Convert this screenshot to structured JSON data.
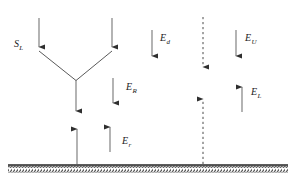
{
  "figure": {
    "type": "energy-flux-diagram",
    "width": 294,
    "height": 186,
    "background_color": "#ffffff",
    "stroke_color": "#3a3a3a",
    "ground_color": "#2b2b2b",
    "label_color": "#1a1a1a"
  },
  "labels": {
    "solar_incoming": {
      "symbol": "S",
      "subscript": "L"
    },
    "downward_d": {
      "symbol": "E",
      "subscript": "d"
    },
    "reflected_R": {
      "symbol": "E",
      "subscript": "R"
    },
    "upper_U": {
      "symbol": "E",
      "subscript": "U"
    },
    "longwave_L": {
      "symbol": "E",
      "subscript": "L"
    },
    "surface_r": {
      "symbol": "E",
      "subscript": "r"
    }
  },
  "arrows": [
    {
      "name": "incoming-left-beam",
      "direction": "down",
      "style": "solid",
      "x1": 39,
      "y1": 18,
      "x2": 39,
      "y2": 48
    },
    {
      "name": "incoming-right-beam",
      "direction": "down",
      "style": "solid",
      "x1": 112,
      "y1": 18,
      "x2": 112,
      "y2": 48
    },
    {
      "name": "scatter-branch-left",
      "direction": "none",
      "style": "solid",
      "x1": 39,
      "y1": 50,
      "x2": 75,
      "y2": 80
    },
    {
      "name": "scatter-branch-right",
      "direction": "none",
      "style": "solid",
      "x1": 112,
      "y1": 50,
      "x2": 76,
      "y2": 80
    },
    {
      "name": "scatter-trunk-down",
      "direction": "down",
      "style": "solid",
      "x1": 76,
      "y1": 80,
      "x2": 76,
      "y2": 112
    },
    {
      "name": "downward-flux-d",
      "direction": "down",
      "style": "solid",
      "x1": 152,
      "y1": 30,
      "x2": 152,
      "y2": 57
    },
    {
      "name": "downward-flux-R",
      "direction": "down",
      "style": "solid",
      "x1": 113,
      "y1": 78,
      "x2": 113,
      "y2": 104
    },
    {
      "name": "downward-flux-U",
      "direction": "down",
      "style": "solid",
      "x1": 236,
      "y1": 30,
      "x2": 236,
      "y2": 57
    },
    {
      "name": "upward-flux-L",
      "direction": "up",
      "style": "solid",
      "x1": 242,
      "y1": 112,
      "x2": 242,
      "y2": 86
    },
    {
      "name": "upward-flux-r",
      "direction": "up",
      "style": "solid",
      "x1": 110,
      "y1": 152,
      "x2": 110,
      "y2": 126
    },
    {
      "name": "surface-emission-left",
      "direction": "up",
      "style": "solid",
      "x1": 77,
      "y1": 164,
      "x2": 77,
      "y2": 128
    },
    {
      "name": "dashed-column-down",
      "direction": "down",
      "style": "dashed",
      "x1": 203,
      "y1": 18,
      "x2": 203,
      "y2": 68
    },
    {
      "name": "dashed-column-up",
      "direction": "up",
      "style": "dashed",
      "x1": 203,
      "y1": 164,
      "x2": 203,
      "y2": 98
    }
  ],
  "ground": {
    "name": "ground-surface",
    "y": 165,
    "x_start": 8,
    "x_end": 288,
    "hatch_height": 7
  }
}
